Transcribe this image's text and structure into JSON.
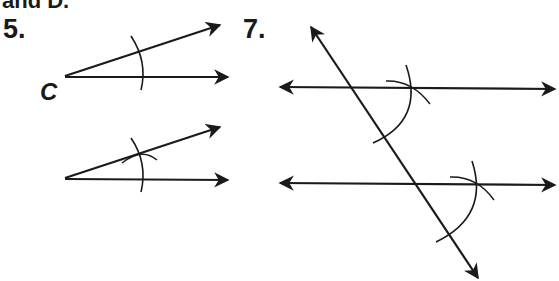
{
  "header": {
    "cut_text": "and D."
  },
  "problems": [
    {
      "number": "5.",
      "vertex_label": "C",
      "description": "Copy angle C using compass arcs"
    },
    {
      "number": "7.",
      "description": "Construct parallel line through transversal using corresponding angles"
    }
  ],
  "colors": {
    "ink": "#1a1a1a",
    "background": "#ffffff"
  }
}
